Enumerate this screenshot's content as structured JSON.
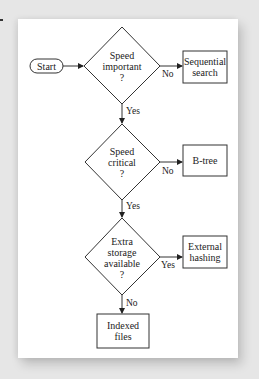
{
  "diagram": {
    "type": "flowchart",
    "nodes": {
      "start": {
        "label": "Start",
        "shape": "terminal"
      },
      "d1": {
        "lines": [
          "Speed",
          "important",
          "?"
        ],
        "shape": "decision"
      },
      "d2": {
        "lines": [
          "Speed",
          "critical",
          "?"
        ],
        "shape": "decision"
      },
      "d3": {
        "lines": [
          "Extra",
          "storage",
          "available",
          "?"
        ],
        "shape": "decision"
      },
      "seq": {
        "lines": [
          "Sequential",
          "search"
        ],
        "shape": "process"
      },
      "btree": {
        "lines": [
          "B-tree"
        ],
        "shape": "process"
      },
      "hash": {
        "lines": [
          "External",
          "hashing"
        ],
        "shape": "process"
      },
      "indexed": {
        "lines": [
          "Indexed",
          "files"
        ],
        "shape": "process"
      }
    },
    "edges": [
      {
        "from": "start",
        "to": "d1",
        "label": ""
      },
      {
        "from": "d1",
        "to": "seq",
        "label": "No"
      },
      {
        "from": "d1",
        "to": "d2",
        "label": "Yes"
      },
      {
        "from": "d2",
        "to": "btree",
        "label": "No"
      },
      {
        "from": "d2",
        "to": "d3",
        "label": "Yes"
      },
      {
        "from": "d3",
        "to": "hash",
        "label": "Yes"
      },
      {
        "from": "d3",
        "to": "indexed",
        "label": "No"
      }
    ],
    "colors": {
      "line": "#333333",
      "background": "#e6e6e6",
      "card": "#ffffff"
    }
  }
}
